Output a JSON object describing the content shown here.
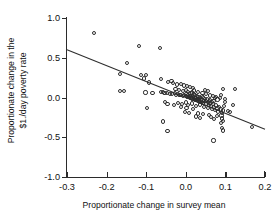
{
  "chart_data": {
    "type": "scatter",
    "title": "",
    "xlabel": "Proportionate change in survey mean",
    "ylabel": "Proportionate change in the $1./day poverty rate",
    "ylabel_line1": "Proportionate change in the",
    "ylabel_line2": "$1./day poverty rate",
    "xlim": [
      -0.3,
      0.2
    ],
    "ylim": [
      -1.0,
      1.0
    ],
    "xticks": [
      -0.3,
      -0.2,
      -0.1,
      0.0,
      0.1,
      0.2
    ],
    "xticklabels": [
      "-0.3",
      "-0.2",
      "-0.1",
      "0.0",
      "0.1",
      "0.2"
    ],
    "yticks": [
      -1.0,
      -0.5,
      0.0,
      0.5,
      1.0
    ],
    "yticklabels": [
      "-1.0",
      "-0.5",
      "0.0",
      "0.5",
      "1.0"
    ],
    "grid": false,
    "legend": null,
    "marker": "open-circle",
    "marker_color": "#2e2e2e",
    "line_color": "#2e2e2e",
    "fit_line": {
      "type": "linear",
      "x_start": -0.3,
      "y_start": 0.6,
      "x_end": 0.2,
      "y_end": -0.4,
      "slope": -2.0,
      "intercept": 0.0
    },
    "points": [
      [
        -0.232,
        0.812
      ],
      [
        -0.118,
        0.648
      ],
      [
        -0.066,
        0.622
      ],
      [
        -0.148,
        0.437
      ],
      [
        -0.167,
        0.293
      ],
      [
        -0.113,
        0.285
      ],
      [
        -0.101,
        0.283
      ],
      [
        -0.106,
        0.238
      ],
      [
        -0.062,
        0.232
      ],
      [
        -0.093,
        0.188
      ],
      [
        -0.045,
        0.198
      ],
      [
        -0.036,
        0.206
      ],
      [
        -0.032,
        0.178
      ],
      [
        -0.022,
        0.163
      ],
      [
        -0.013,
        0.17
      ],
      [
        -0.004,
        0.152
      ],
      [
        0.004,
        0.148
      ],
      [
        0.01,
        0.133
      ],
      [
        0.018,
        0.12
      ],
      [
        -0.167,
        0.082
      ],
      [
        -0.156,
        0.08
      ],
      [
        -0.102,
        0.062
      ],
      [
        -0.063,
        0.07
      ],
      [
        -0.058,
        0.066
      ],
      [
        -0.054,
        0.052
      ],
      [
        -0.048,
        0.06
      ],
      [
        -0.04,
        0.048
      ],
      [
        -0.034,
        0.04
      ],
      [
        -0.028,
        0.055
      ],
      [
        -0.024,
        0.03
      ],
      [
        -0.02,
        0.042
      ],
      [
        -0.016,
        0.028
      ],
      [
        -0.012,
        0.036
      ],
      [
        -0.008,
        0.022
      ],
      [
        -0.004,
        0.03
      ],
      [
        0.0,
        0.018
      ],
      [
        0.002,
        0.044
      ],
      [
        0.004,
        0.01
      ],
      [
        0.006,
        0.026
      ],
      [
        0.008,
        0.002
      ],
      [
        0.01,
        0.018
      ],
      [
        0.012,
        -0.006
      ],
      [
        0.014,
        0.01
      ],
      [
        0.016,
        -0.012
      ],
      [
        0.018,
        0.004
      ],
      [
        0.02,
        -0.02
      ],
      [
        0.022,
        -0.004
      ],
      [
        0.024,
        -0.028
      ],
      [
        0.026,
        -0.012
      ],
      [
        0.028,
        -0.036
      ],
      [
        0.03,
        -0.018
      ],
      [
        0.032,
        -0.044
      ],
      [
        0.034,
        -0.024
      ],
      [
        0.036,
        -0.052
      ],
      [
        0.038,
        -0.03
      ],
      [
        0.04,
        -0.06
      ],
      [
        0.042,
        -0.038
      ],
      [
        0.044,
        -0.068
      ],
      [
        0.046,
        -0.044
      ],
      [
        0.012,
        0.052
      ],
      [
        0.016,
        0.062
      ],
      [
        0.02,
        0.044
      ],
      [
        0.024,
        0.03
      ],
      [
        0.028,
        0.018
      ],
      [
        0.032,
        0.008
      ],
      [
        0.036,
        -0.002
      ],
      [
        0.04,
        0.016
      ],
      [
        0.044,
        0.002
      ],
      [
        0.048,
        -0.014
      ],
      [
        0.052,
        -0.08
      ],
      [
        0.056,
        -0.058
      ],
      [
        0.058,
        -0.096
      ],
      [
        0.06,
        -0.072
      ],
      [
        0.064,
        -0.108
      ],
      [
        0.068,
        -0.086
      ],
      [
        0.072,
        -0.124
      ],
      [
        0.076,
        -0.1
      ],
      [
        0.08,
        -0.138
      ],
      [
        0.084,
        -0.116
      ],
      [
        0.05,
        -0.04
      ],
      [
        0.054,
        -0.026
      ],
      [
        0.058,
        -0.048
      ],
      [
        0.062,
        -0.034
      ],
      [
        0.066,
        -0.056
      ],
      [
        0.07,
        -0.042
      ],
      [
        -0.052,
        -0.06
      ],
      [
        -0.046,
        -0.078
      ],
      [
        -0.03,
        -0.092
      ],
      [
        -0.02,
        -0.07
      ],
      [
        -0.01,
        -0.086
      ],
      [
        0.0,
        -0.064
      ],
      [
        0.006,
        -0.098
      ],
      [
        0.016,
        -0.076
      ],
      [
        0.026,
        -0.11
      ],
      [
        0.036,
        -0.088
      ],
      [
        0.046,
        -0.122
      ],
      [
        0.056,
        -0.134
      ],
      [
        0.066,
        -0.148
      ],
      [
        0.074,
        -0.162
      ],
      [
        0.082,
        -0.176
      ],
      [
        0.088,
        -0.152
      ],
      [
        0.092,
        -0.19
      ],
      [
        0.094,
        -0.164
      ],
      [
        0.09,
        -0.226
      ],
      [
        0.092,
        -0.264
      ],
      [
        0.094,
        -0.292
      ],
      [
        0.088,
        -0.318
      ],
      [
        0.092,
        -0.386
      ],
      [
        0.094,
        -0.414
      ],
      [
        0.096,
        -0.108
      ],
      [
        0.098,
        -0.052
      ],
      [
        0.094,
        0.104
      ],
      [
        0.088,
        0.036
      ],
      [
        0.1,
        -0.02
      ],
      [
        0.106,
        -0.166
      ],
      [
        0.112,
        -0.182
      ],
      [
        0.12,
        -0.09
      ],
      [
        0.124,
        0.102
      ],
      [
        0.168,
        -0.368
      ],
      [
        0.07,
        -0.542
      ],
      [
        -0.057,
        -0.302
      ],
      [
        -0.046,
        -0.424
      ],
      [
        -0.098,
        -0.128
      ],
      [
        -0.084,
        0.052
      ],
      [
        0.008,
        -0.196
      ],
      [
        -0.002,
        -0.178
      ],
      [
        0.03,
        -0.202
      ],
      [
        0.044,
        -0.212
      ],
      [
        0.058,
        -0.222
      ],
      [
        0.018,
        -0.146
      ],
      [
        0.002,
        -0.128
      ],
      [
        -0.012,
        -0.118
      ],
      [
        0.078,
        -0.236
      ],
      [
        0.072,
        -0.268
      ],
      [
        0.064,
        -0.25
      ],
      [
        0.036,
        -0.258
      ],
      [
        0.026,
        -0.24
      ],
      [
        -0.026,
        0.112
      ],
      [
        -0.018,
        0.096
      ],
      [
        -0.008,
        0.082
      ],
      [
        0.0,
        0.092
      ],
      [
        0.006,
        0.074
      ],
      [
        0.02,
        0.088
      ],
      [
        0.03,
        0.07
      ],
      [
        0.042,
        0.06
      ],
      [
        0.05,
        0.044
      ],
      [
        0.062,
        0.024
      ],
      [
        0.074,
        -0.004
      ],
      [
        0.08,
        -0.026
      ],
      [
        0.086,
        -0.01
      ],
      [
        0.048,
        0.096
      ],
      [
        0.056,
        0.082
      ],
      [
        0.068,
        0.018
      ],
      [
        0.076,
        0.002
      ]
    ]
  }
}
